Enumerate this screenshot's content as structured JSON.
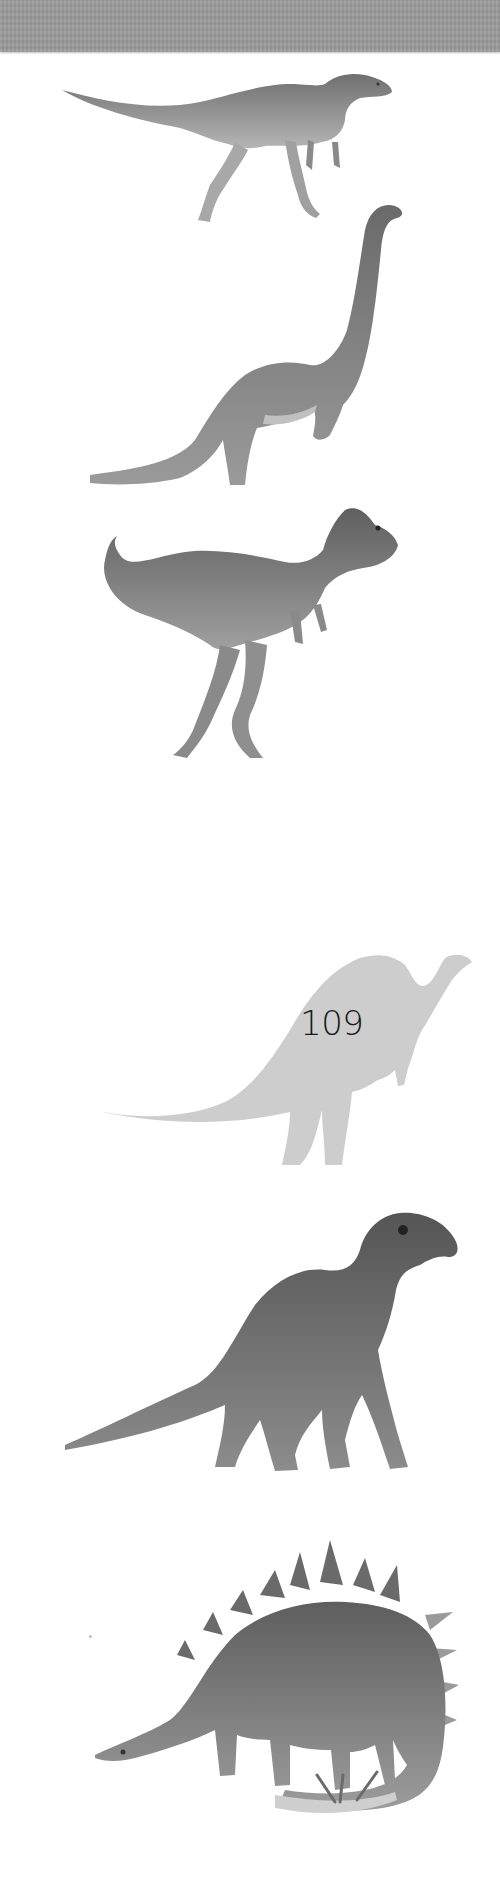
{
  "page": {
    "number": "109",
    "background": "#ffffff",
    "top_band_color": "#9a9a9a"
  },
  "figures": [
    {
      "id": "small-bipedal-dinosaur",
      "kind": "illustration",
      "tone": "#8c8c8c"
    },
    {
      "id": "long-necked-sauropod",
      "kind": "illustration",
      "tone": "#7a7a7a"
    },
    {
      "id": "horned-theropod",
      "kind": "illustration",
      "tone": "#777777"
    },
    {
      "id": "sail-backed-silhouette",
      "kind": "silhouette",
      "tone": "#cdcdcd"
    },
    {
      "id": "iguanodont",
      "kind": "illustration",
      "tone": "#6e6e6e"
    },
    {
      "id": "spiked-stegosaur",
      "kind": "illustration",
      "tone": "#7d7d7d"
    }
  ]
}
